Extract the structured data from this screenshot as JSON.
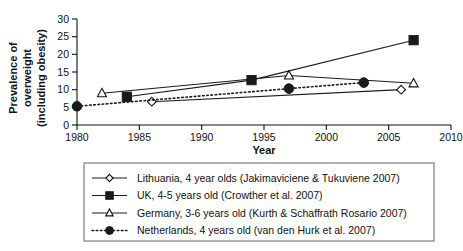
{
  "chart_data": {
    "type": "line",
    "title": "",
    "xlabel": "Year",
    "ylabel": "Prevalence of overweight (including obesity)",
    "ylabel_lines": [
      "Prevalence of",
      "overweight",
      "(including obesity)"
    ],
    "xlim": [
      1980,
      2010
    ],
    "ylim": [
      0,
      30
    ],
    "xticks": [
      1980,
      1985,
      1990,
      1995,
      2000,
      2005,
      2010
    ],
    "yticks": [
      0,
      5,
      10,
      15,
      20,
      25,
      30
    ],
    "grid": false,
    "legend_position": "below",
    "series": [
      {
        "name": "Lithuania, 4 year olds (Jakimaviciene & Tukuviene 2007)",
        "marker": "diamond-open",
        "line_style": "solid",
        "x": [
          1986,
          2006
        ],
        "y": [
          6.6,
          10.0
        ]
      },
      {
        "name": "UK, 4-5 years old (Crowther et al. 2007)",
        "marker": "square-filled",
        "line_style": "solid",
        "x": [
          1984,
          1994,
          2007
        ],
        "y": [
          8.0,
          12.7,
          24.0
        ]
      },
      {
        "name": "Germany, 3-6 years old (Kurth & Schaffrath Rosario 2007)",
        "marker": "triangle-open",
        "line_style": "solid",
        "x": [
          1982,
          1997,
          2007
        ],
        "y": [
          9.0,
          14.0,
          11.8
        ]
      },
      {
        "name": "Netherlands, 4 years old (van den Hurk et al. 2007)",
        "marker": "circle-filled",
        "line_style": "dotted",
        "x": [
          1980,
          1997,
          2003
        ],
        "y": [
          5.3,
          10.3,
          12.0
        ]
      }
    ]
  },
  "legend": {
    "items": [
      {
        "label": "Lithuania, 4 year olds (Jakimaviciene & Tukuviene 2007)",
        "marker": "diamond-open",
        "line_style": "solid"
      },
      {
        "label": "UK, 4-5 years old (Crowther et al. 2007)",
        "marker": "square-filled",
        "line_style": "solid"
      },
      {
        "label": "Germany, 3-6 years old (Kurth & Schaffrath Rosario 2007)",
        "marker": "triangle-open",
        "line_style": "solid"
      },
      {
        "label": "Netherlands, 4 years old (van den Hurk et al. 2007)",
        "marker": "circle-filled",
        "line_style": "dotted"
      }
    ]
  },
  "colors": {
    "ink": "#111111",
    "line": "#1a1a1a",
    "background": "#ffffff",
    "legend_border": "#555555"
  }
}
